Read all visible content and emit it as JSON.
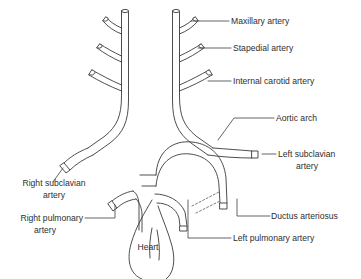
{
  "figure": {
    "background_color": "#ffffff",
    "line_color": "#3a3a3a",
    "text_color": "#2e2e2e",
    "dash_color": "#6b6b6b"
  },
  "labels": {
    "maxillary_artery": "Maxillary artery",
    "stapedial_artery": "Stapedial artery",
    "internal_carotid_artery": "Internal carotid artery",
    "aortic_arch": "Aortic arch",
    "left_subclavian_artery_line1": "Left subclavian",
    "left_subclavian_artery_line2": "artery",
    "right_subclavian_artery_line1": "Right subclavian",
    "right_subclavian_artery_line2": "artery",
    "right_pulmonary_artery_line1": "Right pulmonary",
    "right_pulmonary_artery_line2": "artery",
    "ductus_arteriosus": "Ductus arteriosus",
    "left_pulmonary_artery": "Left pulmonary artery",
    "heart": "Heart"
  }
}
